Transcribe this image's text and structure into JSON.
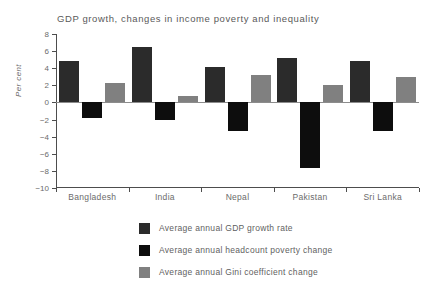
{
  "chart_data": {
    "type": "bar",
    "title": "GDP growth, changes in income poverty and inequality",
    "xlabel": "",
    "ylabel": "Per cent",
    "ylim": [
      -10,
      8
    ],
    "ytick_step": 2,
    "yticks": [
      8,
      6,
      4,
      2,
      0,
      -2,
      -4,
      -6,
      -8,
      -10
    ],
    "grid": false,
    "legend_position": "bottom",
    "categories": [
      "Bangladesh",
      "India",
      "Nepal",
      "Pakistan",
      "Sri Lanka"
    ],
    "series": [
      {
        "name": "Average annual GDP growth rate",
        "color": "#2b2b2b",
        "values": [
          4.9,
          6.5,
          4.2,
          5.2,
          4.9
        ]
      },
      {
        "name": "Average annual headcount poverty change",
        "color": "#0d0d0d",
        "values": [
          -1.8,
          -2.1,
          -3.3,
          -7.7,
          -3.3
        ]
      },
      {
        "name": "Average annual Gini coefficient change",
        "color": "#808080",
        "values": [
          2.3,
          0.8,
          3.2,
          2.0,
          3.0
        ]
      }
    ]
  }
}
